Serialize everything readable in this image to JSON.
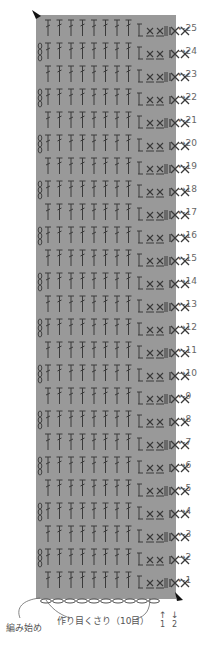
{
  "colors": {
    "chart_bg": "#999999",
    "symbol": "#3a3a3a",
    "text": "#555555"
  },
  "chart": {
    "rows": 25,
    "columns_dc": 8,
    "row_labels": [
      {
        "n": "1",
        "dir": "←"
      },
      {
        "n": "2",
        "dir": "→"
      },
      {
        "n": "3",
        "dir": "←"
      },
      {
        "n": "4",
        "dir": "→"
      },
      {
        "n": "5",
        "dir": "←"
      },
      {
        "n": "6",
        "dir": "→"
      },
      {
        "n": "7",
        "dir": "←"
      },
      {
        "n": "8",
        "dir": "→"
      },
      {
        "n": "9",
        "dir": "←"
      },
      {
        "n": "10",
        "dir": "→"
      },
      {
        "n": "11",
        "dir": "←"
      },
      {
        "n": "12",
        "dir": "→"
      },
      {
        "n": "13",
        "dir": "←"
      },
      {
        "n": "14",
        "dir": "→"
      },
      {
        "n": "15",
        "dir": "←"
      },
      {
        "n": "16",
        "dir": "→"
      },
      {
        "n": "17",
        "dir": "←"
      },
      {
        "n": "18",
        "dir": "→"
      },
      {
        "n": "19",
        "dir": "←"
      },
      {
        "n": "20",
        "dir": "→"
      },
      {
        "n": "21",
        "dir": "←"
      },
      {
        "n": "22",
        "dir": "→"
      },
      {
        "n": "23",
        "dir": "←"
      },
      {
        "n": "24",
        "dir": "→"
      },
      {
        "n": "25",
        "dir": "←"
      }
    ]
  },
  "labels": {
    "start": "編み始め",
    "foundation": "作り目くさり（10目）",
    "bottom_arrows": [
      {
        "arrow": "↑",
        "n": "1"
      },
      {
        "arrow": "↓",
        "n": "2"
      }
    ]
  }
}
